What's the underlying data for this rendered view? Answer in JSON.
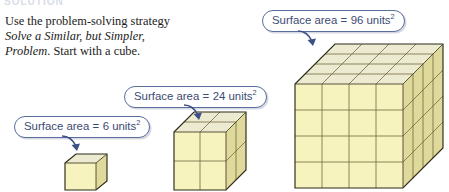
{
  "page": {
    "clipped_heading": "SOLUTION",
    "background_color": "#ffffff"
  },
  "instruction": {
    "line1": "Use the problem-solving strategy",
    "strategy_name_line1": "Solve a Similar, but Simpler,",
    "strategy_name_line2": "Problem",
    "line3_tail": ". Start with a cube.",
    "text_color": "#1b1b1b"
  },
  "colors": {
    "callout_border": "#5a6e9e",
    "callout_text": "#3b4a73",
    "callout_fill": "#ffffff",
    "arrow": "#3c4f86",
    "cube_front": "#f6f3bf",
    "cube_top": "#ecead0",
    "cube_side": "#dfd99b",
    "cube_edge": "#4a4428",
    "cube_outline": "#2c2a18"
  },
  "callouts": [
    {
      "id": "callout-6",
      "label_prefix": "Surface area",
      "equals": "=",
      "value": "6",
      "unit": "units",
      "exponent": "2",
      "full_text": "Surface area = 6 units2",
      "points_to": "small-cube"
    },
    {
      "id": "callout-24",
      "label_prefix": "Surface area",
      "equals": "=",
      "value": "24",
      "unit": "units",
      "exponent": "2",
      "full_text": "Surface area = 24 units2",
      "points_to": "medium-cube"
    },
    {
      "id": "callout-96",
      "label_prefix": "Surface area",
      "equals": "=",
      "value": "96",
      "unit": "units",
      "exponent": "2",
      "full_text": "Surface area = 96 units2",
      "points_to": "large-cube"
    }
  ],
  "cubes": [
    {
      "id": "small-cube",
      "name": "1-by-1-by-1 cube",
      "divisions": 1,
      "edge_units": 1,
      "surface_area": 6,
      "surface_area_text": "6 units2"
    },
    {
      "id": "medium-cube",
      "name": "2-by-2-by-2 cube",
      "divisions": 2,
      "edge_units": 2,
      "surface_area": 24,
      "surface_area_text": "24 units2"
    },
    {
      "id": "large-cube",
      "name": "4-by-4-by-4 cube",
      "divisions": 4,
      "edge_units": 4,
      "surface_area": 96,
      "surface_area_text": "96 units2"
    }
  ]
}
